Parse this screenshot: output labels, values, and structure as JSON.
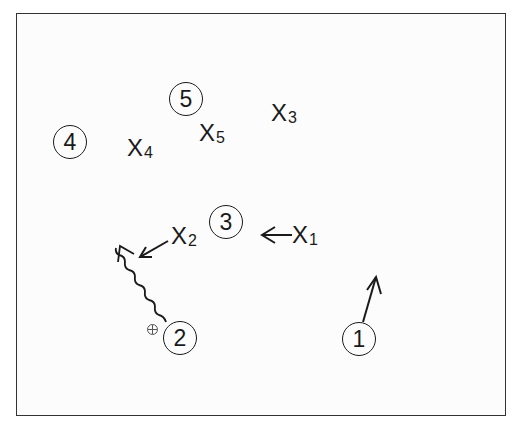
{
  "diagram": {
    "type": "basketball-play",
    "offense": [
      {
        "id": "1",
        "label": "1",
        "x": 359,
        "y": 339,
        "action": "cut",
        "arrow": {
          "from": [
            363,
            321
          ],
          "to": [
            376,
            276
          ]
        }
      },
      {
        "id": "2",
        "label": "2",
        "x": 180,
        "y": 338,
        "action": "dribble",
        "has_ball": true,
        "arrow": {
          "from": [
            166,
            322
          ],
          "to": [
            120,
            246
          ]
        }
      },
      {
        "id": "3",
        "label": "3",
        "x": 226,
        "y": 222
      },
      {
        "id": "4",
        "label": "4",
        "x": 70,
        "y": 142
      },
      {
        "id": "5",
        "label": "5",
        "x": 186,
        "y": 99
      }
    ],
    "defense": [
      {
        "id": "X1",
        "label": "X",
        "sub": "1",
        "x": 300,
        "y": 235,
        "arrow": {
          "from": [
            292,
            235
          ],
          "to": [
            262,
            235
          ]
        }
      },
      {
        "id": "X2",
        "label": "X",
        "sub": "2",
        "x": 172,
        "y": 236,
        "arrow": {
          "from": [
            168,
            240
          ],
          "to": [
            140,
            257
          ]
        }
      },
      {
        "id": "X3",
        "label": "X",
        "sub": "3",
        "x": 270,
        "y": 112
      },
      {
        "id": "X4",
        "label": "X",
        "sub": "4",
        "x": 127,
        "y": 147
      },
      {
        "id": "X5",
        "label": "X",
        "sub": "5",
        "x": 199,
        "y": 133
      }
    ],
    "colors": {
      "ink": "#1a1a1a",
      "frame": "#333333",
      "background": "#fcfcfc"
    }
  }
}
